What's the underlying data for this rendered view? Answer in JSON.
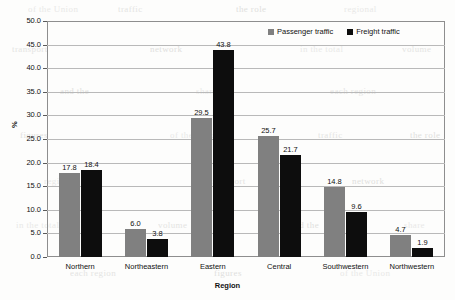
{
  "chart_data": {
    "type": "bar",
    "title": "",
    "xlabel": "Region",
    "ylabel": "%",
    "ylim": [
      0,
      50
    ],
    "ytick_labels": [
      "50.0",
      "45.0",
      "40.0",
      "35.0",
      "30.0",
      "25.0",
      "20.0",
      "15.0",
      "10.0",
      "5.0",
      "0.0"
    ],
    "ytick_values": [
      50,
      45,
      40,
      35,
      30,
      25,
      20,
      15,
      10,
      5,
      0
    ],
    "grid": true,
    "legend_position": "top-right",
    "categories": [
      "Northern",
      "Northeastern",
      "Eastern",
      "Central",
      "Southwestern",
      "Northwestern"
    ],
    "series": [
      {
        "name": "Passenger traffic",
        "color": "#808080",
        "values": [
          17.8,
          6.0,
          29.5,
          25.7,
          14.8,
          4.7
        ],
        "labels": [
          "17.8",
          "6.0",
          "29.5",
          "25.7",
          "14.8",
          "4.7"
        ]
      },
      {
        "name": "Freight traffic",
        "color": "#0d0d0d",
        "values": [
          18.4,
          3.8,
          43.8,
          21.7,
          9.6,
          1.9
        ],
        "labels": [
          "18.4",
          "3.8",
          "43.8",
          "21.7",
          "9.6",
          "1.9"
        ]
      }
    ]
  },
  "legend": {
    "items": [
      {
        "label": "Passenger traffic"
      },
      {
        "label": "Freight traffic"
      }
    ]
  },
  "background_text": [
    "of the Union",
    "traffic",
    "the role",
    "regional",
    "transport",
    "network",
    "in the total",
    "volume",
    "and the",
    "share",
    "each region",
    "figures"
  ]
}
